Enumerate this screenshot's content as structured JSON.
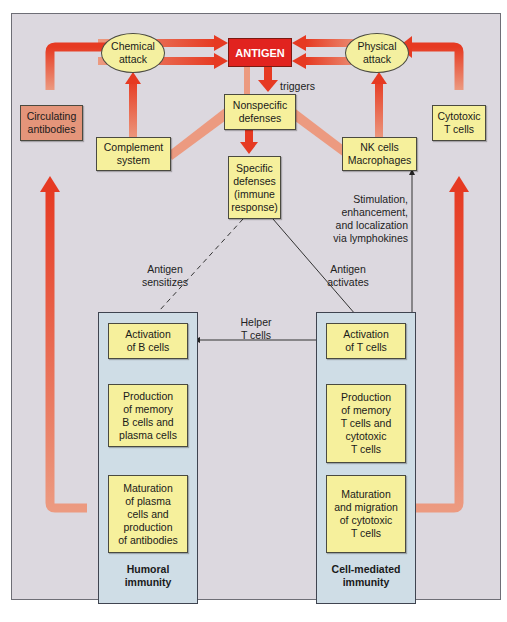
{
  "top_caption": "Sp ... ecific ... and ... sp ... ecific, ... antigen",
  "diagram": {
    "center_node": "ANTIGEN",
    "triggers_label": "triggers",
    "ellipses": {
      "chemical_attack": "Chemical\nattack",
      "physical_attack": "Physical\nattack"
    },
    "boxes": {
      "circulating_antibodies": "Circulating\nantibodies",
      "complement_system": "Complement\nsystem",
      "nonspecific_defenses": "Nonspecific\ndefenses",
      "specific_defenses": "Specific\ndefenses\n(immune\nresponse)",
      "nk_cells_macrophages": "NK cells\nMacrophages",
      "cytotoxic_t_cells": "Cytotoxic\nT cells"
    },
    "labels": {
      "antigen_sensitizes": "Antigen\nsensitizes",
      "antigen_activates": "Antigen\nactivates",
      "helper_t_cells": "Helper\nT cells",
      "stimulation": "Stimulation,\nenhancement,\nand localization\nvia lymphokines"
    },
    "humoral": {
      "title": "Humoral\nimmunity",
      "steps": [
        "Activation\nof B cells",
        "Production\nof memory\nB cells and\nplasma cells",
        "Maturation\nof plasma\ncells and\nproduction\nof antibodies"
      ]
    },
    "cell_mediated": {
      "title": "Cell-mediated\nimmunity",
      "steps": [
        "Activation\nof T cells",
        "Production\nof memory\nT cells and\ncytotoxic\nT cells",
        "Maturation\nand migration\nof cytotoxic\nT cells"
      ]
    },
    "colors": {
      "panel_bg": "#dcd8df",
      "box_fill": "#f6f09c",
      "antigen_fill": "#e1231f",
      "arrow_red": "#e63a22",
      "arrow_light": "#ec9a80",
      "group_fill": "#cfdde6",
      "circulating_fill": "#e4957a"
    }
  },
  "figure_caption": "Figure 2-21  Th..."
}
